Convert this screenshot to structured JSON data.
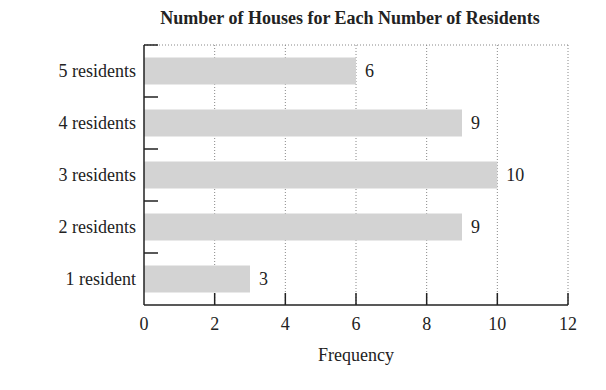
{
  "chart_data": {
    "type": "bar",
    "orientation": "horizontal",
    "title": "Number of Houses for Each Number of Residents",
    "xlabel": "Frequency",
    "ylabel": "",
    "categories": [
      "5 residents",
      "4 residents",
      "3 residents",
      "2 residents",
      "1 resident"
    ],
    "values": [
      6,
      9,
      10,
      9,
      3
    ],
    "data_labels": [
      "6",
      "9",
      "10",
      "9",
      "3"
    ],
    "xlim": [
      0,
      12
    ],
    "xticks": [
      0,
      2,
      4,
      6,
      8,
      10,
      12
    ],
    "grid": "vertical dotted",
    "legend": null,
    "bar_color": "#d3d3d3"
  }
}
